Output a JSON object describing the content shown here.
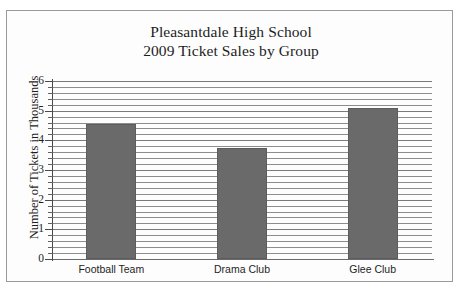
{
  "chart_data": {
    "type": "bar",
    "title": "Pleasantdale High School 2009 Ticket Sales by Group",
    "title_lines": [
      "Pleasantdale High School",
      "2009 Ticket Sales by Group"
    ],
    "categories": [
      "Football Team",
      "Drama Club",
      "Glee Club"
    ],
    "values": [
      4.55,
      3.75,
      5.1
    ],
    "xlabel": "",
    "ylabel": "Number of Tickets in Thousands",
    "ylim": [
      0,
      6
    ],
    "ytick_labels": [
      "0",
      "1",
      "2",
      "3",
      "4",
      "5",
      "6"
    ],
    "ytick_values": [
      0,
      1,
      2,
      3,
      4,
      5,
      6
    ],
    "y_minor_step": 0.2,
    "grid": "horizontal",
    "legend": "none",
    "bar_color": "#6a6a6a",
    "axis_color": "#4a4a4a",
    "grid_color": "#8d8d8d",
    "background_color": "#ffffff",
    "frame_color": "#9a9a9a"
  }
}
